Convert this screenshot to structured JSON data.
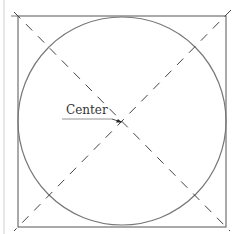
{
  "diagram": {
    "labels": {
      "center": "Center"
    },
    "shapes": {
      "square": {
        "x": 18,
        "y": 16,
        "width": 208,
        "height": 211,
        "stroke": "#555555"
      },
      "circle": {
        "cx": 122,
        "cy": 121,
        "r": 103,
        "stroke": "#777777"
      },
      "diagonals": {
        "style": "dashed",
        "stroke": "#444444"
      },
      "margin_line": {
        "x": 4,
        "stroke": "#cccccc"
      }
    },
    "colors": {
      "background": "#ffffff",
      "line": "#555555",
      "text": "#333333"
    }
  }
}
